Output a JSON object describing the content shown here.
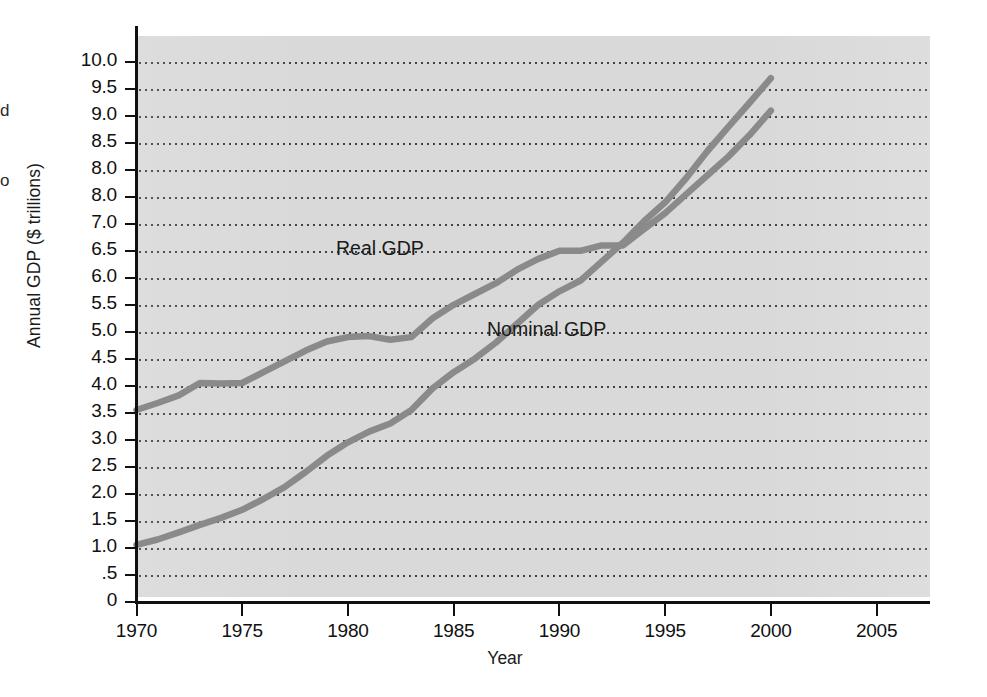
{
  "figure": {
    "y_axis_title": "Annual GDP ($ trillions)",
    "x_axis_title": "Year",
    "edge_fragments": {
      "upper": "d",
      "lower": "o"
    }
  },
  "annotations": {
    "real": "Real GDP",
    "nominal": "Nominal GDP"
  },
  "colors": {
    "plot_background": "#d9d9d9",
    "axis": "#101010",
    "gridline": "#3a3a3a",
    "series_line": "#8a8a8a",
    "page_background": "#ffffff"
  },
  "chart_data": {
    "type": "line",
    "title": "",
    "xlabel": "Year",
    "ylabel": "Annual GDP ($ trillions)",
    "xlim": [
      1970,
      2007.5
    ],
    "ylim": [
      0,
      10.0
    ],
    "grid": true,
    "legend_position": "inline-annotation",
    "x_ticks": [
      1970,
      1975,
      1980,
      1985,
      1990,
      1995,
      2000,
      2005
    ],
    "x_tick_labels": [
      "1970",
      "1975",
      "1980",
      "1985",
      "1990",
      "1995",
      "2000",
      "2005"
    ],
    "y_ticks": [
      0,
      0.5,
      1.0,
      1.5,
      2.0,
      2.5,
      3.0,
      3.5,
      4.0,
      4.5,
      5.0,
      5.5,
      6.0,
      6.5,
      7.0,
      7.5,
      8.0,
      8.5,
      9.0,
      9.5,
      10.0
    ],
    "y_tick_labels": [
      "0",
      ".5",
      "1.0",
      "1.5",
      "2.0",
      "2.5",
      "3.0",
      "3.5",
      "4.0",
      "4.5",
      "5.0",
      "5.5",
      "6.0",
      "6.5",
      "7.0",
      "8.0",
      "8.0",
      "8.5",
      "9.0",
      "9.5",
      "10.0"
    ],
    "y_tick_label_note": "As printed in the scanned figure the 7.5 gridline is labelled 8.0, so 8.0 appears twice.",
    "x": [
      1970,
      1971,
      1972,
      1973,
      1974,
      1975,
      1976,
      1977,
      1978,
      1979,
      1980,
      1981,
      1982,
      1983,
      1984,
      1985,
      1986,
      1987,
      1988,
      1989,
      1990,
      1991,
      1992,
      1993,
      1994,
      1995,
      1996,
      1997,
      1998,
      1999,
      2000
    ],
    "series": [
      {
        "name": "Real GDP",
        "values": [
          3.55,
          3.68,
          3.82,
          4.05,
          4.04,
          4.05,
          4.25,
          4.45,
          4.65,
          4.82,
          4.9,
          4.92,
          4.85,
          4.9,
          5.25,
          5.5,
          5.7,
          5.9,
          6.15,
          6.35,
          6.5,
          6.5,
          6.6,
          6.6,
          6.9,
          7.2,
          7.55,
          7.9,
          8.25,
          8.65,
          9.1
        ]
      },
      {
        "name": "Nominal GDP",
        "values": [
          1.05,
          1.15,
          1.28,
          1.42,
          1.55,
          1.7,
          1.9,
          2.12,
          2.4,
          2.7,
          2.95,
          3.15,
          3.3,
          3.55,
          3.95,
          4.25,
          4.5,
          4.8,
          5.15,
          5.5,
          5.75,
          5.95,
          6.3,
          6.65,
          7.05,
          7.4,
          7.85,
          8.35,
          8.8,
          9.25,
          9.7
        ]
      }
    ]
  }
}
